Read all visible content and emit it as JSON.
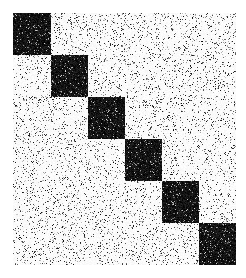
{
  "figure": {
    "title": "",
    "width_px": 246,
    "height_px": 278,
    "background_color": "#ffffff",
    "plot_left_px": 13,
    "plot_top_px": 13,
    "plot_width_px": 223,
    "plot_height_px": 252
  },
  "chart_data": {
    "type": "heatmap",
    "title": "",
    "subtitle": "",
    "xlabel": "",
    "ylabel": "",
    "n_blocks": 6,
    "grid": false,
    "legend": "none",
    "colormap": "binary",
    "color_low": "#ffffff",
    "color_high": "#000000",
    "value_range": [
      0,
      1
    ],
    "xlim": [
      0,
      6
    ],
    "ylim": [
      0,
      6
    ],
    "xticks": [],
    "yticks": [],
    "xticklabels": [],
    "yticklabels": [],
    "block_fill_density": 0.92,
    "background_noise_density": 0.11,
    "noise_seed": 20240517,
    "blocks": [
      {
        "index": 1,
        "row_start": 0,
        "row_end": 1,
        "col_start": 0,
        "col_end": 1,
        "value": 1
      },
      {
        "index": 2,
        "row_start": 1,
        "row_end": 2,
        "col_start": 1,
        "col_end": 2,
        "value": 1
      },
      {
        "index": 3,
        "row_start": 2,
        "row_end": 3,
        "col_start": 2,
        "col_end": 3,
        "value": 1
      },
      {
        "index": 4,
        "row_start": 3,
        "row_end": 4,
        "col_start": 3,
        "col_end": 4,
        "value": 1
      },
      {
        "index": 5,
        "row_start": 4,
        "row_end": 5,
        "col_start": 4,
        "col_end": 5,
        "value": 1
      },
      {
        "index": 6,
        "row_start": 5,
        "row_end": 6,
        "col_start": 5,
        "col_end": 6,
        "value": 1
      }
    ],
    "matrix": [
      [
        1,
        0,
        0,
        0,
        0,
        0
      ],
      [
        0,
        1,
        0,
        0,
        0,
        0
      ],
      [
        0,
        0,
        1,
        0,
        0,
        0
      ],
      [
        0,
        0,
        0,
        1,
        0,
        0
      ],
      [
        0,
        0,
        0,
        0,
        1,
        0
      ],
      [
        0,
        0,
        0,
        0,
        0,
        1
      ]
    ]
  }
}
